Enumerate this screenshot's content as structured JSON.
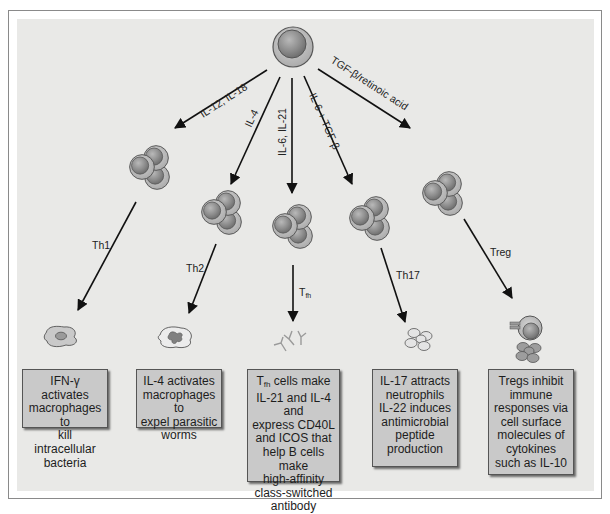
{
  "diagram": {
    "colors": {
      "background": "#e9e9e7",
      "box_fill": "#c9c9c9",
      "cell_outer": "#b4b4b4",
      "cell_inner": "#8c8c8c",
      "arrow": "#111111"
    },
    "source_cell": {
      "label": "naive-cd4-t-cell"
    },
    "pathways": [
      {
        "id": "th1",
        "cytokines": "IL-12, IL-18",
        "subset": "Th1",
        "target_icon": "activated-macrophage-icon",
        "description_lines": [
          "IFN-γ activates",
          "macrophages to",
          "kill intracellular",
          "bacteria"
        ]
      },
      {
        "id": "th2",
        "cytokines": "IL-4",
        "subset": "Th2",
        "target_icon": "eosinophil-macrophage-icon",
        "description_lines": [
          "IL-4 activates",
          "macrophages to",
          "expel parasitic",
          "worms"
        ]
      },
      {
        "id": "tfh",
        "cytokines": "IL-6, IL-21",
        "subset": "T",
        "subset_sub": "fh",
        "target_icon": "antibody-icon",
        "description_first_main": "T",
        "description_first_sub": "fh",
        "description_first_rest": " cells make",
        "description_lines": [
          "IL-21 and IL-4 and",
          "express CD40L",
          "and ICOS that",
          "help B cells make",
          "high-affinity",
          "class-switched",
          "antibody"
        ]
      },
      {
        "id": "th17",
        "cytokines": "IL-6 + TGF-β",
        "subset": "Th17",
        "target_icon": "neutrophil-cluster-icon",
        "description_lines": [
          "IL-17 attracts",
          "neutrophils",
          "IL-22 induces",
          "antimicrobial",
          "peptide",
          "production"
        ]
      },
      {
        "id": "treg",
        "cytokines": "TGF-β/retinoic acid",
        "subset": "Treg",
        "target_icon": "suppressed-cell-icon",
        "description_lines": [
          "Tregs inhibit",
          "immune",
          "responses via",
          "cell surface",
          "molecules of",
          "cytokines",
          "such as IL-10"
        ]
      }
    ]
  }
}
